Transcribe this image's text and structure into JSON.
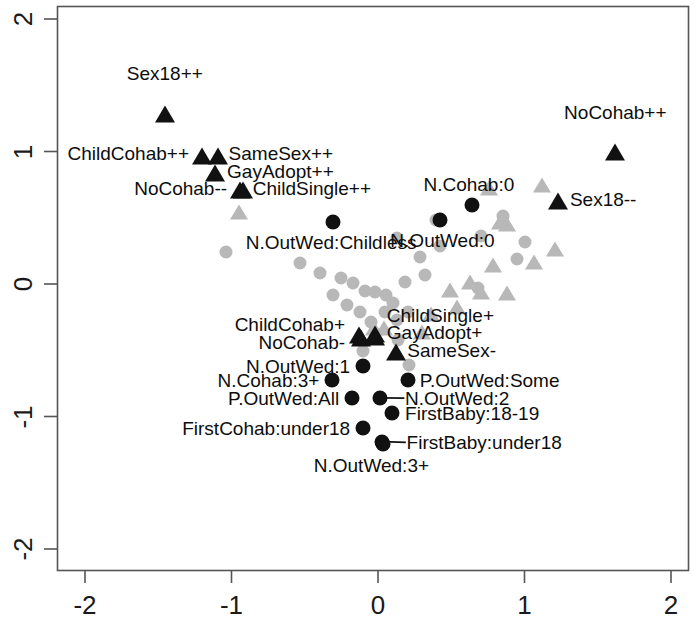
{
  "chart_data": {
    "type": "scatter",
    "title": "",
    "xlabel": "",
    "ylabel": "",
    "xlim": [
      -2.25,
      2.12
    ],
    "ylim": [
      -2.12,
      2.23
    ],
    "xticks": [
      -2,
      -1,
      0,
      1,
      2
    ],
    "yticks": [
      -2,
      -1,
      0,
      1,
      2
    ],
    "xtick_labels": [
      "-2",
      "-1",
      "0",
      "1",
      "2"
    ],
    "ytick_labels": [
      "-2",
      "-1",
      "0",
      "1",
      "2"
    ],
    "grid": false,
    "legend": "none",
    "frame": true,
    "colors": {
      "highlight": "#111111",
      "background_points": "#b8b8b8",
      "axis": "#555555",
      "text": "#111111"
    },
    "series": [
      {
        "name": "highlighted-triangles",
        "marker": "triangle",
        "color": "#111111",
        "points": [
          {
            "label": "Sex18++",
            "x": -1.455,
            "y": 1.3,
            "lx": -1.455,
            "ly": 1.59,
            "anchor": "c"
          },
          {
            "label": "ChildCohab++",
            "x": -1.2,
            "y": 0.985,
            "lx": -1.29,
            "ly": 0.985,
            "anchor": "r"
          },
          {
            "label": "SameSex++",
            "x": -1.095,
            "y": 0.985,
            "lx": -1.02,
            "ly": 0.985,
            "anchor": "l"
          },
          {
            "label": "GayAdopt++",
            "x": -1.11,
            "y": 0.855,
            "lx": -1.03,
            "ly": 0.855,
            "anchor": "l"
          },
          {
            "label": "NoCohab--",
            "x": -0.94,
            "y": 0.725,
            "lx": -1.03,
            "ly": 0.725,
            "anchor": "r"
          },
          {
            "label": "ChildSingle++",
            "x": -0.92,
            "y": 0.725,
            "lx": -0.855,
            "ly": 0.725,
            "anchor": "l"
          },
          {
            "label": "NoCohab++",
            "x": 1.62,
            "y": 1.01,
            "lx": 1.62,
            "ly": 1.3,
            "anchor": "c"
          },
          {
            "label": "Sex18--",
            "x": 1.23,
            "y": 0.64,
            "lx": 1.31,
            "ly": 0.64,
            "anchor": "l"
          },
          {
            "label": "ChildCohab+",
            "x": -0.13,
            "y": -0.37,
            "lx": -0.225,
            "ly": -0.305,
            "anchor": "r"
          },
          {
            "label": "NoCohab-",
            "x": -0.118,
            "y": -0.392,
            "lx": -0.225,
            "ly": -0.435,
            "anchor": "r"
          },
          {
            "label": "ChildSingle+",
            "x": -0.02,
            "y": -0.365,
            "lx": 0.06,
            "ly": -0.235,
            "anchor": "l"
          },
          {
            "label": "GayAdopt+",
            "x": -0.02,
            "y": -0.382,
            "lx": 0.06,
            "ly": -0.36,
            "anchor": "l"
          },
          {
            "label": "SameSex-",
            "x": 0.12,
            "y": -0.5,
            "lx": 0.2,
            "ly": -0.5,
            "anchor": "l"
          }
        ]
      },
      {
        "name": "highlighted-circles",
        "marker": "circle",
        "color": "#111111",
        "points": [
          {
            "label": "N.OutWed:Childless",
            "x": -0.31,
            "y": 0.47,
            "lx": -0.32,
            "ly": 0.32,
            "anchor": "c"
          },
          {
            "label": "N.Cohab:0",
            "x": 0.64,
            "y": 0.6,
            "lx": 0.62,
            "ly": 0.755,
            "anchor": "c"
          },
          {
            "label": "N.OutWed:0",
            "x": 0.425,
            "y": 0.48,
            "lx": 0.44,
            "ly": 0.33,
            "anchor": "c"
          },
          {
            "label": "N.OutWed:1",
            "x": -0.105,
            "y": -0.62,
            "lx": -0.19,
            "ly": -0.62,
            "anchor": "r"
          },
          {
            "label": "N.Cohab:3+",
            "x": -0.315,
            "y": -0.725,
            "lx": -0.4,
            "ly": -0.725,
            "anchor": "r"
          },
          {
            "label": "P.OutWed:Some",
            "x": 0.205,
            "y": -0.725,
            "lx": 0.285,
            "ly": -0.725,
            "anchor": "l"
          },
          {
            "label": "P.OutWed:All",
            "x": -0.18,
            "y": -0.86,
            "lx": -0.265,
            "ly": -0.86,
            "anchor": "r"
          },
          {
            "label": "N.OutWed:2",
            "x": 0.012,
            "y": -0.86,
            "lx": 0.185,
            "ly": -0.86,
            "anchor": "l"
          },
          {
            "label": "FirstBaby:18-19",
            "x": 0.095,
            "y": -0.975,
            "lx": 0.185,
            "ly": -0.975,
            "anchor": "l"
          },
          {
            "label": "FirstCohab:under18",
            "x": -0.105,
            "y": -1.085,
            "lx": -0.19,
            "ly": -1.085,
            "anchor": "r"
          },
          {
            "label": "FirstBaby:under18",
            "x": 0.03,
            "y": -1.19,
            "lx": 0.195,
            "ly": -1.19,
            "anchor": "l"
          },
          {
            "label": "N.OutWed:3+",
            "x": 0.032,
            "y": -1.205,
            "lx": -0.045,
            "ly": -1.365,
            "anchor": "c"
          }
        ]
      },
      {
        "name": "background-circles",
        "marker": "circle",
        "color": "#b8b8b8",
        "points": [
          {
            "x": -1.04,
            "y": 0.24
          },
          {
            "x": -0.53,
            "y": 0.16
          },
          {
            "x": -0.395,
            "y": 0.085
          },
          {
            "x": -0.255,
            "y": 0.045
          },
          {
            "x": -0.17,
            "y": 0.01
          },
          {
            "x": -0.09,
            "y": -0.055
          },
          {
            "x": -0.305,
            "y": -0.08
          },
          {
            "x": -0.21,
            "y": -0.16
          },
          {
            "x": -0.125,
            "y": -0.215
          },
          {
            "x": 0.055,
            "y": -0.085
          },
          {
            "x": 0.105,
            "y": -0.14
          },
          {
            "x": 0.045,
            "y": -0.21
          },
          {
            "x": -0.05,
            "y": -0.29
          },
          {
            "x": 0.13,
            "y": -0.275
          },
          {
            "x": 0.215,
            "y": -0.61
          },
          {
            "x": 0.205,
            "y": -0.215
          },
          {
            "x": 0.135,
            "y": -0.42
          },
          {
            "x": -0.105,
            "y": -0.505
          },
          {
            "x": 0.13,
            "y": 0.345
          },
          {
            "x": 0.29,
            "y": 0.205
          },
          {
            "x": 0.32,
            "y": 0.065
          },
          {
            "x": 0.395,
            "y": 0.48
          },
          {
            "x": 0.42,
            "y": 0.285
          },
          {
            "x": 0.7,
            "y": 0.36
          },
          {
            "x": 0.855,
            "y": 0.51
          },
          {
            "x": 0.95,
            "y": 0.185
          },
          {
            "x": 1.0,
            "y": 0.32
          },
          {
            "x": 0.68,
            "y": -0.03
          },
          {
            "x": -0.02,
            "y": -0.06
          },
          {
            "x": 0.185,
            "y": 0.015
          }
        ]
      },
      {
        "name": "background-triangles",
        "marker": "triangle",
        "color": "#b8b8b8",
        "points": [
          {
            "x": -0.95,
            "y": 0.56
          },
          {
            "x": 0.76,
            "y": 0.735
          },
          {
            "x": 1.12,
            "y": 0.76
          },
          {
            "x": 0.83,
            "y": 0.48
          },
          {
            "x": 0.88,
            "y": 0.47
          },
          {
            "x": 1.21,
            "y": 0.275
          },
          {
            "x": 1.065,
            "y": 0.18
          },
          {
            "x": 0.785,
            "y": 0.155
          },
          {
            "x": 0.63,
            "y": 0.03
          },
          {
            "x": 0.705,
            "y": -0.05
          },
          {
            "x": 0.49,
            "y": -0.035
          },
          {
            "x": 0.54,
            "y": -0.16
          },
          {
            "x": 0.88,
            "y": -0.055
          },
          {
            "x": 0.36,
            "y": -0.215
          },
          {
            "x": 0.04,
            "y": -0.315
          },
          {
            "x": -0.03,
            "y": -0.32
          },
          {
            "x": 0.3,
            "y": -0.35
          }
        ]
      }
    ],
    "leaders": [
      {
        "x1": -0.02,
        "y1": -0.382,
        "x2": 0.055,
        "y2": -0.36
      },
      {
        "x1": 0.03,
        "y1": -1.19,
        "x2": 0.19,
        "y2": -1.195
      },
      {
        "x1": 0.012,
        "y1": -0.86,
        "x2": 0.18,
        "y2": -0.862
      }
    ]
  }
}
